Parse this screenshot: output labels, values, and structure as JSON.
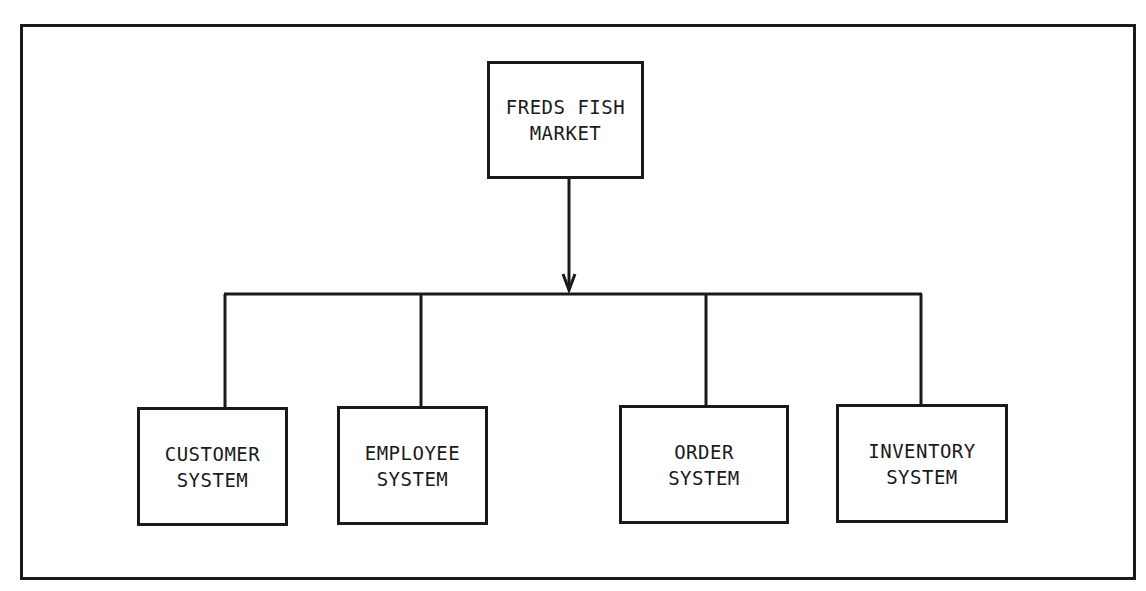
{
  "diagram": {
    "type": "hierarchy-chart",
    "root": {
      "line1": "FREDS FISH",
      "line2": "MARKET"
    },
    "children": [
      {
        "line1": "CUSTOMER",
        "line2": "SYSTEM"
      },
      {
        "line1": "EMPLOYEE",
        "line2": "SYSTEM"
      },
      {
        "line1": "ORDER",
        "line2": "SYSTEM"
      },
      {
        "line1": "INVENTORY",
        "line2": "SYSTEM"
      }
    ],
    "colors": {
      "line": "#1a1a1a",
      "background": "#ffffff"
    }
  }
}
